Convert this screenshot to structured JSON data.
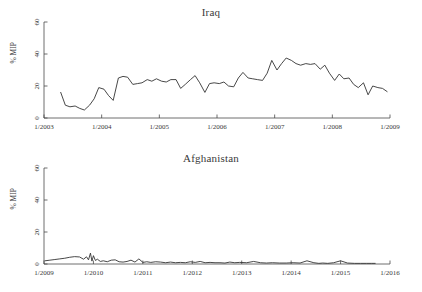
{
  "figure": {
    "width": 422,
    "height": 292,
    "background": "#ffffff",
    "line_color": "#333333",
    "axis_color": "#4a4a4a",
    "text_color": "#3a3a3a"
  },
  "panels": [
    {
      "key": "iraq",
      "title": "Iraq",
      "ylabel": "% MIP"
    },
    {
      "key": "afghanistan",
      "title": "Afghanistan",
      "ylabel": "% MIP"
    }
  ],
  "chart_data": [
    {
      "type": "line",
      "title": "Iraq",
      "xlabel": "",
      "ylabel": "% MIP",
      "ylim": [
        0,
        60
      ],
      "yticks": [
        0,
        20,
        40,
        60
      ],
      "ytick_labels": [
        "0",
        "20",
        "40",
        "60"
      ],
      "xlim": [
        2003.0,
        2009.0
      ],
      "xticks": [
        2003.0,
        2004.0,
        2005.0,
        2006.0,
        2007.0,
        2008.0,
        2009.0
      ],
      "xtick_labels": [
        "1/2003",
        "1/2004",
        "1/2005",
        "1/2006",
        "1/2007",
        "1/2008",
        "1/2009"
      ],
      "grid": false,
      "legend": false,
      "series": [
        {
          "name": "Iraq % MIP",
          "x": [
            2003.29,
            2003.37,
            2003.45,
            2003.54,
            2003.62,
            2003.7,
            2003.79,
            2003.87,
            2003.95,
            2004.04,
            2004.12,
            2004.2,
            2004.29,
            2004.37,
            2004.45,
            2004.54,
            2004.62,
            2004.7,
            2004.79,
            2004.87,
            2004.95,
            2005.04,
            2005.12,
            2005.2,
            2005.29,
            2005.37,
            2005.45,
            2005.54,
            2005.62,
            2005.7,
            2005.79,
            2005.87,
            2005.95,
            2006.04,
            2006.12,
            2006.2,
            2006.29,
            2006.37,
            2006.45,
            2006.54,
            2006.62,
            2006.7,
            2006.79,
            2006.87,
            2006.95,
            2007.04,
            2007.12,
            2007.2,
            2007.29,
            2007.37,
            2007.45,
            2007.54,
            2007.62,
            2007.7,
            2007.79,
            2007.87,
            2007.95,
            2008.04,
            2008.12,
            2008.2,
            2008.29,
            2008.37,
            2008.45,
            2008.54,
            2008.62,
            2008.7,
            2008.79,
            2008.87,
            2008.95
          ],
          "values": [
            16,
            8,
            7,
            7.5,
            6,
            5,
            8,
            12,
            19,
            18,
            14,
            11,
            25,
            26,
            25.5,
            21,
            21.5,
            22,
            24,
            23,
            24.5,
            23,
            22.5,
            24,
            24,
            18.5,
            21,
            24,
            26.5,
            22,
            16,
            21.5,
            22,
            21.5,
            22.5,
            20,
            19.5,
            25,
            28.5,
            25,
            24.5,
            24,
            23.5,
            28,
            36,
            30,
            34,
            37.5,
            36,
            34,
            33,
            34,
            33.5,
            34,
            30.5,
            33,
            28,
            23.5,
            27.5,
            24.5,
            25,
            21,
            19,
            22,
            14.5,
            20,
            19,
            18.5,
            16.5
          ]
        }
      ]
    },
    {
      "type": "line",
      "title": "Afghanistan",
      "xlabel": "",
      "ylabel": "% MIP",
      "ylim": [
        0,
        60
      ],
      "yticks": [
        0,
        20,
        40,
        60
      ],
      "ytick_labels": [
        "0",
        "20",
        "40",
        "60"
      ],
      "xlim": [
        2009.0,
        2016.0
      ],
      "xticks": [
        2009.0,
        2010.0,
        2011.0,
        2012.0,
        2013.0,
        2014.0,
        2015.0,
        2016.0
      ],
      "xtick_labels": [
        "1/2009",
        "1/2010",
        "1/2011",
        "1/2012",
        "1/2013",
        "1/2014",
        "1/2015",
        "1/2016"
      ],
      "grid": false,
      "legend": false,
      "series": [
        {
          "name": "Afghanistan % MIP",
          "x": [
            2009.02,
            2009.12,
            2009.22,
            2009.32,
            2009.42,
            2009.52,
            2009.62,
            2009.72,
            2009.8,
            2009.86,
            2009.9,
            2009.94,
            2009.97,
            2010.0,
            2010.04,
            2010.08,
            2010.14,
            2010.2,
            2010.28,
            2010.36,
            2010.44,
            2010.52,
            2010.6,
            2010.68,
            2010.76,
            2010.84,
            2010.92,
            2011.0,
            2011.08,
            2011.16,
            2011.26,
            2011.36,
            2011.46,
            2011.56,
            2011.66,
            2011.76,
            2011.86,
            2011.96,
            2012.06,
            2012.16,
            2012.26,
            2012.36,
            2012.46,
            2012.56,
            2012.66,
            2012.76,
            2012.86,
            2012.96,
            2013.1,
            2013.24,
            2013.38,
            2013.5,
            2013.62,
            2013.76,
            2013.9,
            2014.04,
            2014.18,
            2014.32,
            2014.46,
            2014.56,
            2014.64,
            2014.74,
            2014.86,
            2015.0,
            2015.14,
            2015.28,
            2015.4,
            2015.52,
            2015.62,
            2015.7
          ],
          "values": [
            2.0,
            2.4,
            2.8,
            3.2,
            3.6,
            4.2,
            4.6,
            4.4,
            3.0,
            4.5,
            2.6,
            6.8,
            1.8,
            5.2,
            2.2,
            3.0,
            1.6,
            2.0,
            1.4,
            2.4,
            2.6,
            1.4,
            1.2,
            1.6,
            2.4,
            1.2,
            3.2,
            1.0,
            1.4,
            1.0,
            1.4,
            1.2,
            0.8,
            1.2,
            0.8,
            1.0,
            0.8,
            1.4,
            1.0,
            1.6,
            0.8,
            1.0,
            0.8,
            0.8,
            0.6,
            1.2,
            0.8,
            1.0,
            0.8,
            1.6,
            0.8,
            0.6,
            0.8,
            0.6,
            0.6,
            0.8,
            0.6,
            2.0,
            0.8,
            0.4,
            0.6,
            0.4,
            0.8,
            2.0,
            0.6,
            0.4,
            0.4,
            0.4,
            0.4,
            0.4
          ]
        }
      ]
    }
  ]
}
